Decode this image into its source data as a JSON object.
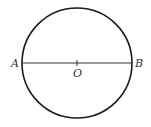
{
  "diagram": {
    "type": "circle-with-diameter",
    "colors": {
      "stroke": "#1a1a1a",
      "text": "#333333",
      "background": "#ffffff"
    },
    "circle": {
      "center": [
        77,
        63
      ],
      "radius": 55
    },
    "diameter": {
      "from": "A",
      "to": "B"
    },
    "points": [
      {
        "name": "A",
        "label": "A"
      },
      {
        "name": "O",
        "label": "O"
      },
      {
        "name": "B",
        "label": "B"
      }
    ]
  }
}
